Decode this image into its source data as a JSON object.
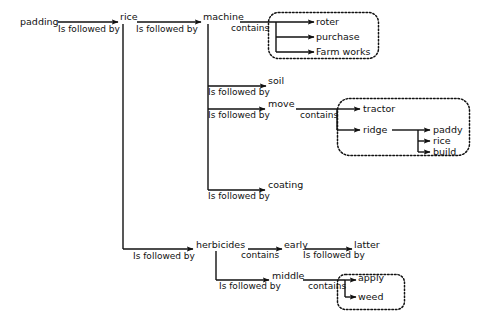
{
  "diagram": {
    "type": "relationship-tree-diagram",
    "background_color": "#ffffff",
    "line_color": "#111111",
    "relations": {
      "is_followed_by": "Is followed by",
      "contains": "contains"
    },
    "nodes": {
      "padding": "padding",
      "rice": "rice",
      "machine": "machine",
      "roter": "roter",
      "purchase": "purchase",
      "farm_works": "Farm works",
      "soil": "soil",
      "move": "move",
      "tractor": "tractor",
      "ridge": "ridge",
      "paddy": "paddy",
      "rice2": "rice",
      "build": "build",
      "coating": "coating",
      "herbicides": "herbicides",
      "early": "early",
      "latter": "latter",
      "middle": "middle",
      "apply": "apply",
      "weed": "weed"
    },
    "edge_labels": {
      "padding_to_rice": "Is followed by",
      "rice_to_machine": "Is followed by",
      "machine_contains": "contains",
      "machine_to_soil": "Is followed by",
      "machine_to_move": "Is followed by",
      "move_contains": "contains",
      "machine_to_coating": "Is followed by",
      "rice_to_herbicides": "Is followed by",
      "herbicides_contains": "contains",
      "early_to_latter": "Is followed by",
      "herbicides_to_middle": "Is followed by",
      "middle_contains": "contains"
    },
    "groups": [
      {
        "name": "machine-contains-group",
        "members": [
          "roter",
          "purchase",
          "Farm works"
        ]
      },
      {
        "name": "move-contains-group",
        "members": [
          "tractor",
          "ridge",
          "paddy",
          "rice",
          "build"
        ]
      },
      {
        "name": "middle-contains-group",
        "members": [
          "apply",
          "weed"
        ]
      }
    ]
  }
}
